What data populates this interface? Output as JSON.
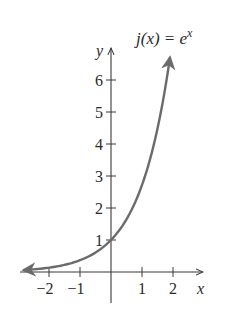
{
  "chart_data": {
    "type": "line",
    "function_label": {
      "name": "j(x) = e",
      "exponent": "x"
    },
    "xlabel": "x",
    "ylabel": "y",
    "xlim": [
      -2.8,
      2.9
    ],
    "ylim": [
      -0.3,
      7.0
    ],
    "x_ticks": [
      -2,
      -1,
      1,
      2
    ],
    "x_tick_labels": [
      "−2",
      "−1",
      "1",
      "2"
    ],
    "y_ticks": [
      1,
      2,
      3,
      4,
      5,
      6
    ],
    "y_tick_labels": [
      "1",
      "2",
      "3",
      "4",
      "5",
      "6"
    ],
    "grid": false,
    "legend": null,
    "series": [
      {
        "name": "j(x) = e^x",
        "color": "#6b6b6b",
        "x": [
          -2.8,
          -2,
          -1,
          0,
          0.5,
          1,
          1.5,
          1.9
        ],
        "y": [
          0.06,
          0.14,
          0.37,
          1.0,
          1.65,
          2.72,
          4.48,
          6.69
        ],
        "arrows": "both"
      }
    ]
  },
  "style": {
    "axis_color": "#3a3a3a",
    "curve_color": "#6b6b6b",
    "background": "#ffffff"
  },
  "layout": {
    "origin_px": [
      111,
      272
    ],
    "unit_px_x": 31,
    "unit_px_y": 32
  }
}
